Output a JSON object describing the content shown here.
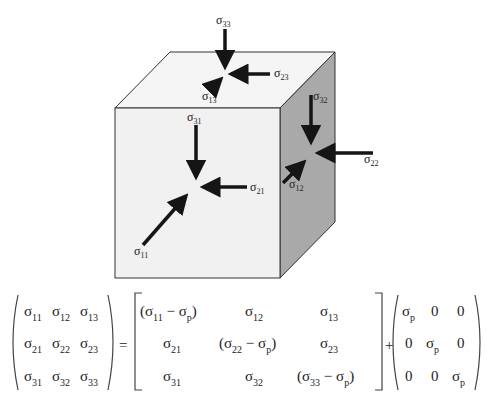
{
  "figure": {
    "labels": {
      "s33": {
        "base": "σ",
        "sub": "33"
      },
      "s23": {
        "base": "σ",
        "sub": "23"
      },
      "s13": {
        "base": "σ",
        "sub": "13"
      },
      "s32": {
        "base": "σ",
        "sub": "32"
      },
      "s22": {
        "base": "σ",
        "sub": "22"
      },
      "s12": {
        "base": "σ",
        "sub": "12"
      },
      "s31": {
        "base": "σ",
        "sub": "31"
      },
      "s21": {
        "base": "σ",
        "sub": "21"
      },
      "s11": {
        "base": "σ",
        "sub": "11"
      }
    },
    "colors": {
      "front_face": "#f1f1f1",
      "top_face": "#f5f5f5",
      "right_face": "#a9a9a9",
      "arrow": "#151515",
      "edge": "#333333"
    }
  },
  "equation": {
    "lhs": [
      [
        "σ11",
        "σ12",
        "σ13"
      ],
      [
        "σ21",
        "σ22",
        "σ23"
      ],
      [
        "σ31",
        "σ32",
        "σ33"
      ]
    ],
    "equals": "=",
    "deviatoric": [
      [
        "(σ11 − σp)",
        "σ12",
        "σ13"
      ],
      [
        "σ21",
        "(σ22 − σp)",
        "σ23"
      ],
      [
        "σ31",
        "σ32",
        "(σ33 − σp)"
      ]
    ],
    "plus": "+",
    "hydrostatic": [
      [
        "σp",
        "0",
        "0"
      ],
      [
        "0",
        "σp",
        "0"
      ],
      [
        "0",
        "0",
        "σp"
      ]
    ]
  }
}
